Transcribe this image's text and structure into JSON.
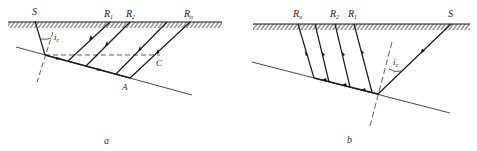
{
  "diagram_a": {
    "caption": "a",
    "source_label": "S",
    "receivers": [
      {
        "label": "R",
        "sub": "1"
      },
      {
        "label": "R",
        "sub": "2"
      },
      {
        "label": "R",
        "sub": "n"
      }
    ],
    "angle_label": "i",
    "angle_sub": "c",
    "point_A": "A",
    "point_C": "C"
  },
  "diagram_b": {
    "caption": "b",
    "source_label": "S",
    "receivers": [
      {
        "label": "R",
        "sub": "n"
      },
      {
        "label": "R",
        "sub": "2"
      },
      {
        "label": "R",
        "sub": "1"
      }
    ],
    "angle_label": "i",
    "angle_sub": "c"
  },
  "colors": {
    "ink": "#1a1a1a",
    "background": "#ffffff"
  }
}
